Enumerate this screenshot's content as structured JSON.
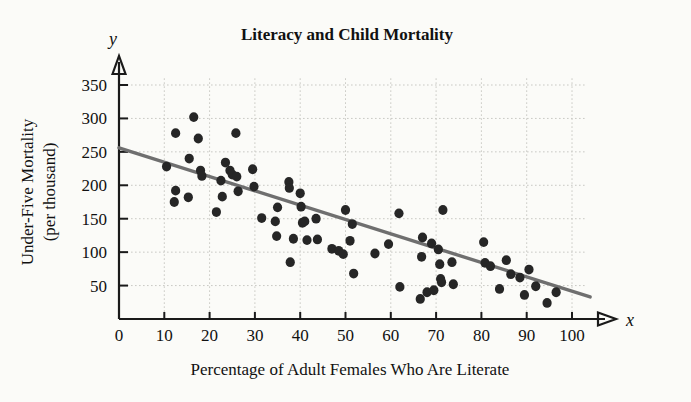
{
  "chart_data": {
    "type": "scatter",
    "title": "Literacy and Child Mortality",
    "xlabel": "Percentage of Adult Females Who Are Literate",
    "ylabel_line1": "Under-Five Mortality",
    "ylabel_line2": "(per thousand)",
    "x_axis_symbol": "x",
    "y_axis_symbol": "y",
    "xlim": [
      0,
      103
    ],
    "ylim": [
      0,
      372
    ],
    "grid": true,
    "legend": "none",
    "xticks": [
      0,
      10,
      20,
      30,
      40,
      50,
      60,
      70,
      80,
      90,
      100
    ],
    "xtick_labels": [
      "0",
      "10",
      "20",
      "30",
      "40",
      "50",
      "60",
      "70",
      "80",
      "90",
      "100"
    ],
    "yticks": [
      50,
      100,
      150,
      200,
      250,
      300,
      350
    ],
    "ytick_labels": [
      "50",
      "100",
      "150",
      "200",
      "250",
      "300",
      "350"
    ],
    "point_color": "#262626",
    "trend_color": "#6f6f6f",
    "grid_color": "#c9c9c4",
    "axis_color": "#1a1a1a",
    "trend_line": {
      "x_start": 0,
      "y_start": 256,
      "x_end": 104,
      "y_end": 33
    },
    "points": [
      {
        "x": 10.5,
        "y": 228
      },
      {
        "x": 12.5,
        "y": 278
      },
      {
        "x": 12.5,
        "y": 192
      },
      {
        "x": 12.2,
        "y": 175
      },
      {
        "x": 15.5,
        "y": 240
      },
      {
        "x": 15.3,
        "y": 182
      },
      {
        "x": 16.5,
        "y": 302
      },
      {
        "x": 17.5,
        "y": 270
      },
      {
        "x": 18.0,
        "y": 222
      },
      {
        "x": 18.3,
        "y": 214
      },
      {
        "x": 21.5,
        "y": 160
      },
      {
        "x": 22.5,
        "y": 207
      },
      {
        "x": 22.8,
        "y": 183
      },
      {
        "x": 23.5,
        "y": 234
      },
      {
        "x": 24.5,
        "y": 222
      },
      {
        "x": 25.0,
        "y": 216
      },
      {
        "x": 25.8,
        "y": 278
      },
      {
        "x": 26.0,
        "y": 213
      },
      {
        "x": 26.3,
        "y": 191
      },
      {
        "x": 29.5,
        "y": 224
      },
      {
        "x": 29.8,
        "y": 198
      },
      {
        "x": 31.5,
        "y": 151
      },
      {
        "x": 34.5,
        "y": 146
      },
      {
        "x": 34.8,
        "y": 124
      },
      {
        "x": 35.0,
        "y": 167
      },
      {
        "x": 37.5,
        "y": 205
      },
      {
        "x": 37.6,
        "y": 196
      },
      {
        "x": 37.8,
        "y": 85
      },
      {
        "x": 38.5,
        "y": 120
      },
      {
        "x": 40.0,
        "y": 188
      },
      {
        "x": 40.2,
        "y": 168
      },
      {
        "x": 40.5,
        "y": 144
      },
      {
        "x": 41.0,
        "y": 146
      },
      {
        "x": 41.5,
        "y": 118
      },
      {
        "x": 43.5,
        "y": 150
      },
      {
        "x": 43.8,
        "y": 119
      },
      {
        "x": 47.0,
        "y": 105
      },
      {
        "x": 48.5,
        "y": 102
      },
      {
        "x": 49.5,
        "y": 97
      },
      {
        "x": 50.0,
        "y": 163
      },
      {
        "x": 51.0,
        "y": 117
      },
      {
        "x": 51.5,
        "y": 142
      },
      {
        "x": 51.8,
        "y": 68
      },
      {
        "x": 56.5,
        "y": 98
      },
      {
        "x": 59.5,
        "y": 112
      },
      {
        "x": 61.8,
        "y": 158
      },
      {
        "x": 62.0,
        "y": 48
      },
      {
        "x": 66.5,
        "y": 30
      },
      {
        "x": 66.8,
        "y": 93
      },
      {
        "x": 67.0,
        "y": 122
      },
      {
        "x": 68.0,
        "y": 40
      },
      {
        "x": 69.0,
        "y": 113
      },
      {
        "x": 69.5,
        "y": 43
      },
      {
        "x": 70.5,
        "y": 104
      },
      {
        "x": 70.8,
        "y": 82
      },
      {
        "x": 71.0,
        "y": 60
      },
      {
        "x": 71.2,
        "y": 55
      },
      {
        "x": 71.5,
        "y": 163
      },
      {
        "x": 73.5,
        "y": 85
      },
      {
        "x": 73.8,
        "y": 52
      },
      {
        "x": 80.5,
        "y": 115
      },
      {
        "x": 80.8,
        "y": 84
      },
      {
        "x": 82.0,
        "y": 79
      },
      {
        "x": 84.0,
        "y": 45
      },
      {
        "x": 85.5,
        "y": 88
      },
      {
        "x": 86.5,
        "y": 67
      },
      {
        "x": 88.5,
        "y": 62
      },
      {
        "x": 89.5,
        "y": 36
      },
      {
        "x": 90.5,
        "y": 74
      },
      {
        "x": 92.0,
        "y": 49
      },
      {
        "x": 94.5,
        "y": 24
      },
      {
        "x": 96.5,
        "y": 40
      }
    ]
  }
}
